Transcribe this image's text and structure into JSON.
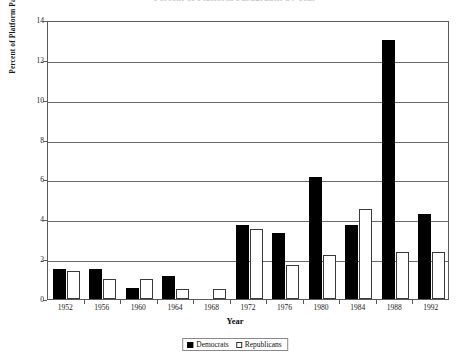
{
  "chart_data": {
    "type": "bar",
    "title": "Percent of Platform Paragraphs by Year",
    "xlabel": "Year",
    "ylabel": "Percent of Platform Paragraphs",
    "categories": [
      "1952",
      "1956",
      "1960",
      "1964",
      "1968",
      "1972",
      "1976",
      "1980",
      "1984",
      "1988",
      "1992"
    ],
    "series": [
      {
        "name": "Democrats",
        "color": "#000000",
        "values": [
          1.5,
          1.5,
          0.55,
          1.15,
          0,
          3.7,
          3.3,
          6.1,
          3.7,
          13.0,
          4.25
        ]
      },
      {
        "name": "Republicans",
        "color": "#ffffff",
        "values": [
          1.4,
          1.0,
          1.0,
          0.5,
          0.5,
          3.5,
          1.7,
          2.2,
          4.5,
          2.35,
          2.35
        ]
      }
    ],
    "ylim": [
      0,
      14
    ],
    "yticks": [
      0,
      2,
      4,
      6,
      8,
      10,
      12,
      14
    ],
    "ytick_labels": [
      "0",
      "2",
      "4",
      "6",
      "8",
      "10",
      "12",
      "14"
    ],
    "grid": true,
    "legend_position": "bottom-center"
  },
  "legend": {
    "items": [
      {
        "label": "Democrats",
        "swatch": "filled-square-black"
      },
      {
        "label": "Republicans",
        "swatch": "open-square-white"
      }
    ]
  }
}
